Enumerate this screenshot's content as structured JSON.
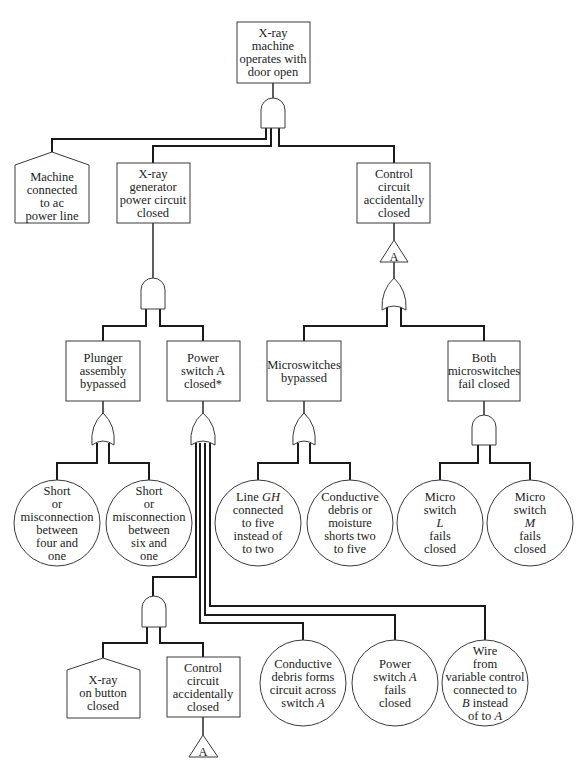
{
  "diagram": {
    "type": "fault-tree",
    "nodes": {
      "top": {
        "shape": "rectangle",
        "lines": [
          "X-ray",
          "machine",
          "operates with",
          "door open"
        ]
      },
      "machine_ac": {
        "shape": "house",
        "lines": [
          "Machine",
          "connected",
          "to ac",
          "power line"
        ]
      },
      "generator": {
        "shape": "rectangle",
        "lines": [
          "X-ray",
          "generator",
          "power circuit",
          "closed"
        ]
      },
      "control": {
        "shape": "rectangle",
        "lines": [
          "Control",
          "circuit",
          "accidentally",
          "closed"
        ]
      },
      "transfer_a_top": {
        "shape": "transfer-triangle",
        "label": "A"
      },
      "plunger": {
        "shape": "rectangle",
        "lines": [
          "Plunger",
          "assembly",
          "bypassed"
        ]
      },
      "power_switch": {
        "shape": "rectangle",
        "lines": [
          "Power",
          "switch A",
          "closed*"
        ]
      },
      "micro_bypassed": {
        "shape": "rectangle",
        "lines": [
          "Microswitches",
          "bypassed"
        ]
      },
      "both_micro": {
        "shape": "rectangle",
        "lines": [
          "Both",
          "microswitches",
          "fail closed"
        ]
      },
      "short_four": {
        "shape": "circle",
        "lines": [
          "Short",
          "or",
          "misconnection",
          "between",
          "four and",
          "one"
        ]
      },
      "short_six": {
        "shape": "circle",
        "lines": [
          "Short",
          "or",
          "misconnection",
          "between",
          "six and",
          "one"
        ]
      },
      "line_gh": {
        "shape": "circle",
        "lines": [
          "Line |GH|",
          "connected",
          "to five",
          "instead of",
          "to two"
        ]
      },
      "conductive_moisture": {
        "shape": "circle",
        "lines": [
          "Conductive",
          "debris or",
          "moisture",
          "shorts two",
          "to five"
        ]
      },
      "micro_l": {
        "shape": "circle",
        "lines": [
          "Micro",
          "switch",
          "|L|",
          "fails",
          "closed"
        ]
      },
      "micro_m": {
        "shape": "circle",
        "lines": [
          "Micro",
          "switch",
          "|M|",
          "fails",
          "closed"
        ]
      },
      "xray_button": {
        "shape": "house",
        "lines": [
          "X-ray",
          "on button",
          "closed"
        ]
      },
      "control2": {
        "shape": "rectangle",
        "lines": [
          "Control",
          "circuit",
          "accidentally",
          "closed"
        ]
      },
      "transfer_a_bottom": {
        "shape": "transfer-triangle",
        "label": "A"
      },
      "debris_switch": {
        "shape": "circle",
        "lines": [
          "Conductive",
          "debris forms",
          "circuit across",
          "switch |A|"
        ]
      },
      "switch_fails": {
        "shape": "circle",
        "lines": [
          "Power",
          "switch |A|",
          "fails",
          "closed"
        ]
      },
      "wire_variable": {
        "shape": "circle",
        "lines": [
          "Wire",
          "from",
          "variable control",
          "connected to",
          "|B| instead",
          "of to |A|"
        ]
      }
    },
    "gates": {
      "g_top": {
        "type": "AND",
        "inputs": [
          "machine_ac",
          "generator",
          "control"
        ]
      },
      "g_generator": {
        "type": "AND",
        "inputs": [
          "plunger",
          "power_switch"
        ]
      },
      "g_control": {
        "type": "OR",
        "inputs": [
          "micro_bypassed",
          "both_micro"
        ]
      },
      "g_plunger": {
        "type": "OR",
        "inputs": [
          "short_four",
          "short_six"
        ]
      },
      "g_power": {
        "type": "OR",
        "inputs": [
          "g_button_and",
          "debris_switch",
          "switch_fails",
          "wire_variable"
        ]
      },
      "g_micro_bypassed": {
        "type": "OR",
        "inputs": [
          "line_gh",
          "conductive_moisture"
        ]
      },
      "g_both_micro": {
        "type": "AND",
        "inputs": [
          "micro_l",
          "micro_m"
        ]
      },
      "g_button_and": {
        "type": "AND",
        "inputs": [
          "xray_button",
          "control2"
        ]
      }
    }
  }
}
